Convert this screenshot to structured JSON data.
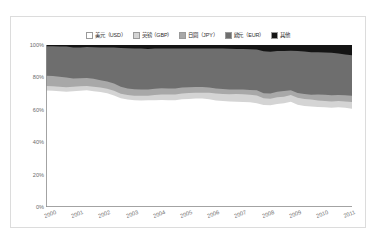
{
  "chart_data": {
    "type": "area",
    "stacked": true,
    "normalized": true,
    "title": "",
    "subtitle": "",
    "xlabel": "",
    "ylabel": "",
    "grid": false,
    "legend_position": "top-center",
    "xlim": [
      2000,
      2011.25
    ],
    "ylim": [
      0,
      100
    ],
    "ytick_labels": [
      "0%",
      "20%",
      "40%",
      "60%",
      "80%",
      "100%"
    ],
    "ytick_values": [
      0,
      20,
      40,
      60,
      80,
      100
    ],
    "xtick_labels": [
      "2000",
      "2001",
      "2002",
      "2003",
      "2004",
      "2005",
      "2006",
      "2007",
      "2008",
      "2009",
      "2010",
      "2011"
    ],
    "xtick_values": [
      2000,
      2001,
      2002,
      2003,
      2004,
      2005,
      2006,
      2007,
      2008,
      2009,
      2010,
      2011
    ],
    "x": [
      2000,
      2000.25,
      2000.5,
      2000.75,
      2001,
      2001.25,
      2001.5,
      2001.75,
      2002,
      2002.25,
      2002.5,
      2002.75,
      2003,
      2003.25,
      2003.5,
      2003.75,
      2004,
      2004.25,
      2004.5,
      2004.75,
      2005,
      2005.25,
      2005.5,
      2005.75,
      2006,
      2006.25,
      2006.5,
      2006.75,
      2007,
      2007.25,
      2007.5,
      2007.75,
      2008,
      2008.25,
      2008.5,
      2008.75,
      2009,
      2009.25,
      2009.5,
      2009.75,
      2010,
      2010.25,
      2010.5,
      2010.75,
      2011,
      2011.25
    ],
    "series": [
      {
        "name": "美元（USD）",
        "color": "#ffffff",
        "values": [
          71.9,
          71.8,
          71.5,
          71.1,
          71.5,
          71.8,
          72.0,
          71.5,
          71.0,
          70.2,
          68.9,
          67.1,
          66.3,
          65.9,
          65.8,
          65.9,
          65.9,
          66.1,
          65.9,
          65.9,
          66.5,
          66.7,
          66.9,
          66.9,
          66.5,
          65.8,
          65.4,
          65.1,
          65.0,
          64.8,
          64.6,
          64.1,
          63.0,
          62.8,
          63.6,
          64.1,
          64.9,
          63.1,
          62.4,
          62.1,
          61.8,
          61.6,
          61.3,
          61.5,
          61.2,
          60.7
        ]
      },
      {
        "name": "英镑（GBP）",
        "color": "#d4d4d4",
        "values": [
          2.8,
          2.8,
          2.8,
          2.8,
          2.7,
          2.7,
          2.7,
          2.7,
          2.8,
          2.8,
          2.8,
          2.8,
          2.8,
          2.8,
          2.8,
          2.8,
          3.3,
          3.4,
          3.5,
          3.5,
          3.6,
          3.6,
          3.6,
          3.6,
          4.0,
          4.2,
          4.4,
          4.5,
          4.7,
          4.8,
          4.7,
          4.7,
          4.1,
          4.0,
          4.1,
          4.0,
          4.2,
          4.3,
          4.3,
          4.3,
          3.9,
          3.9,
          3.9,
          3.9,
          4.0,
          4.1
        ]
      },
      {
        "name": "日圆（JPY）",
        "color": "#a8a8a8",
        "values": [
          6.3,
          6.2,
          6.1,
          6.1,
          5.1,
          5.0,
          5.0,
          5.0,
          4.4,
          4.4,
          4.5,
          4.4,
          4.1,
          4.0,
          4.0,
          3.9,
          3.8,
          3.8,
          3.8,
          3.8,
          3.6,
          3.6,
          3.5,
          3.5,
          3.2,
          3.1,
          3.1,
          3.0,
          2.9,
          2.9,
          2.9,
          3.2,
          3.1,
          3.2,
          3.4,
          3.5,
          3.0,
          3.0,
          3.0,
          2.9,
          3.7,
          3.8,
          3.8,
          3.8,
          3.8,
          3.9
        ]
      },
      {
        "name": "欧元（EUR）",
        "color": "#6e6e6e",
        "values": [
          18.3,
          18.4,
          18.7,
          19.1,
          19.2,
          19.0,
          19.0,
          19.4,
          20.3,
          21.0,
          22.2,
          23.8,
          24.8,
          25.2,
          25.2,
          25.0,
          24.8,
          24.5,
          24.6,
          24.6,
          24.1,
          23.9,
          23.8,
          23.8,
          24.1,
          24.7,
          24.9,
          25.1,
          25.0,
          25.0,
          25.2,
          25.2,
          26.0,
          25.9,
          25.2,
          24.7,
          24.3,
          25.9,
          26.3,
          26.3,
          26.2,
          26.0,
          26.2,
          25.6,
          25.1,
          24.9
        ]
      },
      {
        "name": "其他",
        "color": "#141414",
        "values": [
          0.7,
          0.8,
          0.9,
          0.9,
          1.5,
          1.5,
          1.3,
          1.4,
          1.5,
          1.6,
          1.6,
          1.9,
          2.0,
          2.1,
          2.2,
          2.4,
          2.2,
          2.2,
          2.2,
          2.2,
          2.2,
          2.2,
          2.2,
          2.2,
          2.2,
          2.2,
          2.2,
          2.3,
          2.4,
          2.5,
          2.6,
          2.8,
          3.8,
          4.1,
          3.7,
          3.7,
          3.6,
          3.7,
          4.0,
          4.4,
          4.4,
          4.7,
          4.8,
          5.2,
          5.9,
          6.4
        ]
      }
    ]
  },
  "axis": {
    "y_labels": [
      "100%",
      "80%",
      "60%",
      "40%",
      "20%",
      "0%"
    ],
    "x_labels": [
      "2000",
      "2001",
      "2002",
      "2003",
      "2004",
      "2005",
      "2006",
      "2007",
      "2008",
      "2009",
      "2010",
      "2011"
    ]
  },
  "legend": {
    "items": [
      {
        "label": "美元（USD）",
        "color": "#ffffff"
      },
      {
        "label": "英镑（GBP）",
        "color": "#d4d4d4"
      },
      {
        "label": "日圆（JPY）",
        "color": "#a8a8a8"
      },
      {
        "label": "欧元（EUR）",
        "color": "#6e6e6e"
      },
      {
        "label": "其他",
        "color": "#141414"
      }
    ]
  },
  "style": {
    "axis_color": "#8c8c8c",
    "tick_text_color": "#6b6b6b",
    "frame_color": "#dcdcdc",
    "background": "#ffffff"
  }
}
